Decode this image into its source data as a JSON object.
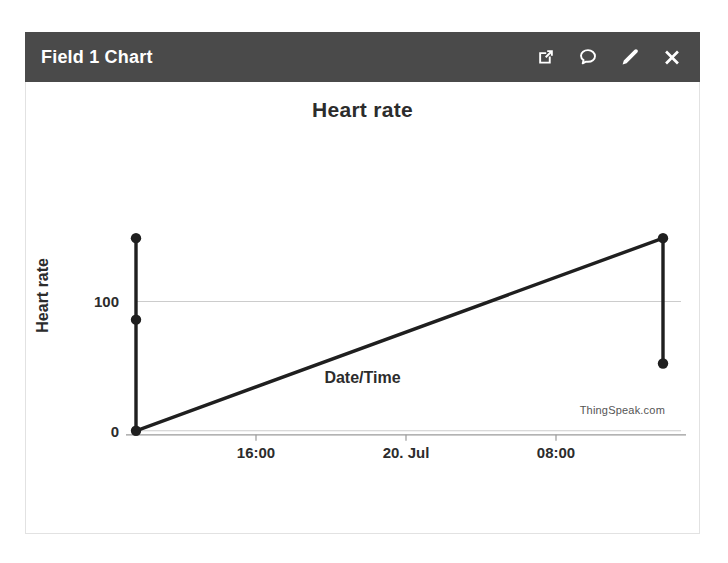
{
  "window": {
    "title": "Field 1 Chart",
    "header_bg": "#4a4a4a",
    "header_text_color": "#ffffff",
    "actions": [
      {
        "name": "popout-icon",
        "label": "Open in new window"
      },
      {
        "name": "comment-icon",
        "label": "Comment"
      },
      {
        "name": "edit-icon",
        "label": "Edit"
      },
      {
        "name": "close-icon",
        "label": "Close"
      }
    ]
  },
  "chart_data": {
    "type": "line",
    "title": "Heart rate",
    "xlabel": "Date/Time",
    "ylabel": "Heart rate",
    "watermark": "ThingSpeak.com",
    "grid": true,
    "legend": "none",
    "line_color": "#1f1f1f",
    "grid_color": "#cccccc",
    "axis_color": "#8a8a8a",
    "x_tick_labels": [
      "16:00",
      "20. Jul",
      "08:00"
    ],
    "y_tick_labels": [
      "100",
      "0"
    ],
    "ylim": [
      0,
      160
    ],
    "yticks": [
      0,
      100
    ],
    "x": [
      "19. Jul 12:00",
      "19. Jul 12:05",
      "19. Jul 12:10",
      "20. Jul 14:30",
      "20. Jul 14:35"
    ],
    "values": [
      149,
      86,
      0,
      149,
      52
    ],
    "points": [
      {
        "x_frac": 0.0,
        "value": 149
      },
      {
        "x_frac": 0.0,
        "value": 86
      },
      {
        "x_frac": 0.0,
        "value": 0
      },
      {
        "x_frac": 1.0,
        "value": 149
      },
      {
        "x_frac": 1.0,
        "value": 52
      }
    ]
  }
}
